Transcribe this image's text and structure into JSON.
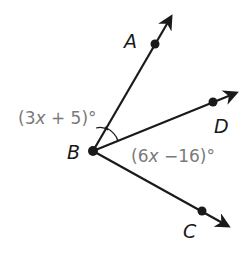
{
  "diagram": {
    "type": "angle-rays",
    "vertex": {
      "label": "B",
      "x": 93,
      "y": 151
    },
    "points": [
      {
        "label": "A",
        "x": 155,
        "y": 44,
        "tip_x": 172,
        "tip_y": 15,
        "label_x": 124,
        "label_y": 48
      },
      {
        "label": "D",
        "x": 213,
        "y": 102,
        "tip_x": 238,
        "tip_y": 92,
        "label_x": 215,
        "label_y": 132
      },
      {
        "label": "C",
        "x": 202,
        "y": 211,
        "tip_x": 230,
        "tip_y": 227,
        "label_x": 183,
        "label_y": 237
      }
    ],
    "angles": [
      {
        "name": "angle-ABD",
        "expression_prefix": "(3",
        "variable": "x",
        "expression_suffix": " + 5)°"
      },
      {
        "name": "angle-DBC",
        "expression_prefix": "(6",
        "variable": "x",
        "expression_suffix": " −16)°"
      }
    ],
    "colors": {
      "line": "#1a1a1a",
      "label": "#1a1a1a",
      "expression": "#7a7a7a"
    }
  }
}
